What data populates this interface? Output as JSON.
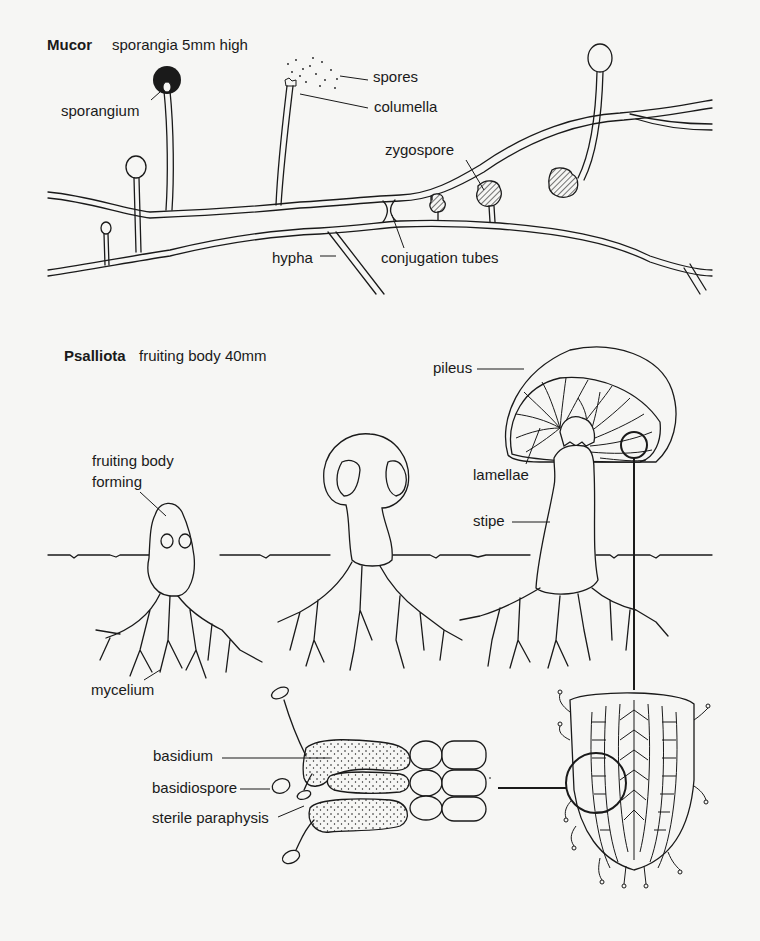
{
  "mucor": {
    "title": "Mucor",
    "caption": "sporangia 5mm high",
    "labels": {
      "sporangium": "sporangium",
      "spores": "spores",
      "columella": "columella",
      "zygospore": "zygospore",
      "hypha": "hypha",
      "conjugation_tubes": "conjugation tubes"
    }
  },
  "psalliota": {
    "title": "Psalliota",
    "caption": "fruiting body 40mm",
    "labels": {
      "fruiting_body_forming_line1": "fruiting body",
      "fruiting_body_forming_line2": "forming",
      "pileus": "pileus",
      "lamellae": "lamellae",
      "stipe": "stipe",
      "mycelium": "mycelium",
      "basidium": "basidium",
      "basidiospore": "basidiospore",
      "sterile_paraphysis": "sterile paraphysis"
    }
  },
  "colors": {
    "background": "#f6f6f4",
    "ink": "#1a1a1a"
  }
}
